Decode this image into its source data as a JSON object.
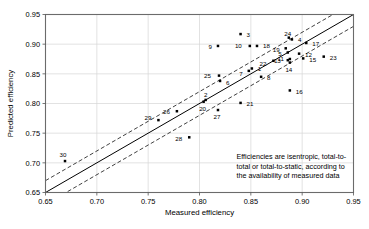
{
  "chart_data": {
    "type": "scatter",
    "title": "",
    "xlabel": "Measured efficiency",
    "ylabel": "Predicted efficiency",
    "xlim": [
      0.65,
      0.95
    ],
    "ylim": [
      0.65,
      0.95
    ],
    "xticks": [
      "0.65",
      "0.70",
      "0.75",
      "0.80",
      "0.85",
      "0.90",
      "0.95"
    ],
    "yticks": [
      "0.65",
      "0.70",
      "0.75",
      "0.80",
      "0.85",
      "0.90",
      "0.95"
    ],
    "xtick_values": [
      0.65,
      0.7,
      0.75,
      0.8,
      0.85,
      0.9,
      0.95
    ],
    "ytick_values": [
      0.65,
      0.7,
      0.75,
      0.8,
      0.85,
      0.9,
      0.95
    ],
    "grid": true,
    "legend": "none",
    "reference_lines": [
      {
        "name": "parity",
        "style": "solid",
        "offset": 0.0
      },
      {
        "name": "upper-band",
        "style": "dashed",
        "offset": 0.02
      },
      {
        "name": "lower-band",
        "style": "dashed",
        "offset": -0.02
      }
    ],
    "marker": "filled-square",
    "marker_color": "#000000",
    "points": [
      {
        "label": "1",
        "x": 0.851,
        "y": 0.859,
        "lx": 6,
        "ly": 0
      },
      {
        "label": "2",
        "x": 0.806,
        "y": 0.806,
        "lx": 0,
        "ly": -5
      },
      {
        "label": "3",
        "x": 0.84,
        "y": 0.917,
        "lx": 6,
        "ly": 1
      },
      {
        "label": "4",
        "x": 0.89,
        "y": 0.908,
        "lx": 6,
        "ly": 0
      },
      {
        "label": "5",
        "x": 0.886,
        "y": 0.886,
        "lx": -6,
        "ly": 1
      },
      {
        "label": "6",
        "x": 0.82,
        "y": 0.838,
        "lx": 6,
        "ly": 2
      },
      {
        "label": "7",
        "x": 0.848,
        "y": 0.855,
        "lx": -6,
        "ly": 3
      },
      {
        "label": "8",
        "x": 0.86,
        "y": 0.845,
        "lx": 6,
        "ly": 1
      },
      {
        "label": "9",
        "x": 0.818,
        "y": 0.897,
        "lx": -6,
        "ly": 1
      },
      {
        "label": "10",
        "x": 0.849,
        "y": 0.897,
        "lx": -8,
        "ly": 0
      },
      {
        "label": "11",
        "x": 0.888,
        "y": 0.875,
        "lx": -6,
        "ly": 0
      },
      {
        "label": "12",
        "x": 0.897,
        "y": 0.884,
        "lx": 6,
        "ly": 1
      },
      {
        "label": "13",
        "x": 0.886,
        "y": 0.873,
        "lx": -7,
        "ly": 1
      },
      {
        "label": "14",
        "x": 0.888,
        "y": 0.869,
        "lx": -1,
        "ly": 7
      },
      {
        "label": "15",
        "x": 0.901,
        "y": 0.876,
        "lx": 6,
        "ly": 1
      },
      {
        "label": "16",
        "x": 0.888,
        "y": 0.822,
        "lx": 6,
        "ly": 1
      },
      {
        "label": "17",
        "x": 0.904,
        "y": 0.902,
        "lx": 6,
        "ly": 1
      },
      {
        "label": "18",
        "x": 0.856,
        "y": 0.897,
        "lx": 6,
        "ly": 0
      },
      {
        "label": "19",
        "x": 0.884,
        "y": 0.893,
        "lx": -6,
        "ly": 1
      },
      {
        "label": "20",
        "x": 0.804,
        "y": 0.803,
        "lx": -1,
        "ly": 7
      },
      {
        "label": "21",
        "x": 0.84,
        "y": 0.801,
        "lx": 6,
        "ly": 1
      },
      {
        "label": "22",
        "x": 0.872,
        "y": 0.872,
        "lx": -7,
        "ly": 3
      },
      {
        "label": "23",
        "x": 0.921,
        "y": 0.879,
        "lx": 6,
        "ly": 1
      },
      {
        "label": "24",
        "x": 0.887,
        "y": 0.911,
        "lx": -1,
        "ly": -4
      },
      {
        "label": "25",
        "x": 0.819,
        "y": 0.847,
        "lx": -8,
        "ly": 0
      },
      {
        "label": "26",
        "x": 0.778,
        "y": 0.787,
        "lx": -7,
        "ly": 1
      },
      {
        "label": "27",
        "x": 0.818,
        "y": 0.789,
        "lx": -1,
        "ly": 7
      },
      {
        "label": "28",
        "x": 0.79,
        "y": 0.743,
        "lx": -7,
        "ly": 1
      },
      {
        "label": "29",
        "x": 0.76,
        "y": 0.772,
        "lx": -7,
        "ly": -2
      },
      {
        "label": "30",
        "x": 0.669,
        "y": 0.703,
        "lx": -2,
        "ly": -6
      }
    ],
    "annotation": {
      "lines": [
        "Efficiencies are isentropic, total-to-",
        "total or total-to-static, according to",
        "the availability of measured data"
      ],
      "x": 0.836,
      "y": 0.706
    }
  }
}
